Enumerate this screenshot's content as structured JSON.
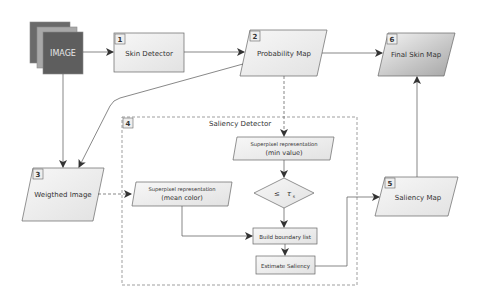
{
  "nodes": {
    "image": {
      "label": "IMAGE"
    },
    "skin_detector": {
      "badge": "1",
      "label": "Skin Detector"
    },
    "probability_map": {
      "badge": "2",
      "label": "Probability Map"
    },
    "weighted_image": {
      "badge": "3",
      "label": "Weigthed Image"
    },
    "saliency_detector": {
      "badge": "4",
      "label": "Saliency Detector"
    },
    "saliency_map": {
      "badge": "5",
      "label": "Saliency Map"
    },
    "final_skin_map": {
      "badge": "6",
      "label": "Final Skin Map"
    },
    "superpixel_min": {
      "line1": "Superpixel representation",
      "line2": "(min value)"
    },
    "threshold": {
      "op": "≤",
      "symbol": "τ",
      "subscript": "s"
    },
    "superpixel_mean": {
      "line1": "Superpixel representation",
      "line2": "(mean color)"
    },
    "build_boundary": {
      "label": "Build boundary list"
    },
    "estimate_saliency": {
      "label": "Estimate Saliency"
    }
  },
  "colors": {
    "stroke": "#555555",
    "image_dark": "#5a5a5a",
    "image_mid": "#9a9a9a",
    "fill_light": "#f0f0f0",
    "gradient_dark": "#a8a8a8"
  }
}
